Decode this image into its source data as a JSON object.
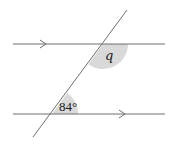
{
  "diagram": {
    "type": "parallel-lines-transversal",
    "colors": {
      "line": "#6e6e6e",
      "shade": "#d9d9d9",
      "text": "#1a1a1a",
      "background": "#ffffff"
    },
    "parallel_lines": [
      {
        "name": "top-parallel-line",
        "arrow": "right-pointing",
        "arrow_position": "left"
      },
      {
        "name": "bottom-parallel-line",
        "arrow": "right-pointing",
        "arrow_position": "right"
      }
    ],
    "angles": {
      "unknown": {
        "label": "q",
        "position": "below top line, right of transversal"
      },
      "given": {
        "label": "84°",
        "value": 84,
        "unit": "degrees",
        "position": "above bottom line, right of transversal"
      }
    }
  }
}
